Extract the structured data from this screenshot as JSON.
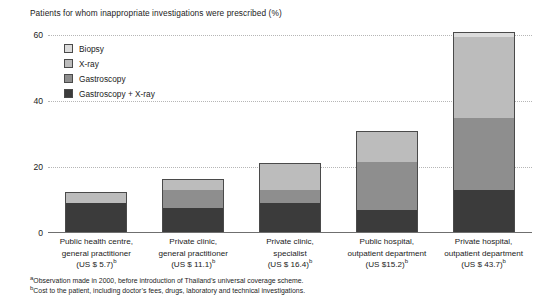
{
  "chart_data": {
    "type": "bar",
    "title": "Patients for whom inappropriate investigations were prescribed (%)",
    "xlabel": "",
    "ylabel": "",
    "ylim": [
      0,
      60
    ],
    "yticks": [
      0,
      20,
      40,
      60
    ],
    "ytick_labels": [
      "0",
      "20",
      "40",
      "60"
    ],
    "grid": true,
    "stacked": true,
    "legend_position": "upper-left-inside",
    "categories": [
      "Public health centre, general practitioner (US $ 5.7)",
      "Private clinic, general practitioner (US $ 11.1)",
      "Private clinic, specialist (US $ 16.4)",
      "Public hospital, outpatient department (US $15.2)",
      "Private hospital, outpatient department (US $ 43.7)"
    ],
    "series": [
      {
        "name": "Gastroscopy + X-ray",
        "color": "#3b3b3b",
        "values": [
          9.0,
          7.5,
          9.0,
          7.0,
          13.0
        ]
      },
      {
        "name": "Gastroscopy",
        "color": "#8e8e8e",
        "values": [
          0.0,
          5.5,
          4.0,
          14.5,
          22.0
        ]
      },
      {
        "name": "X-ray",
        "color": "#bcbcbc",
        "values": [
          3.5,
          3.3,
          8.3,
          9.5,
          24.5
        ]
      },
      {
        "name": "Biopsy",
        "color": "#dcdcdc",
        "values": [
          0.0,
          0.0,
          0.0,
          0.0,
          1.5
        ]
      }
    ],
    "totals": [
      12.5,
      16.3,
      21.3,
      31.0,
      61.0
    ]
  },
  "legend": {
    "items": [
      {
        "label": "Biopsy",
        "color": "#dcdcdc"
      },
      {
        "label": "X-ray",
        "color": "#bcbcbc"
      },
      {
        "label": "Gastroscopy",
        "color": "#8e8e8e"
      },
      {
        "label": "Gastroscopy + X-ray",
        "color": "#3b3b3b"
      }
    ]
  },
  "categories": [
    {
      "line1": "Public health centre,",
      "line2": "general practitioner",
      "line3": "(US $ 5.7)",
      "marker": "b"
    },
    {
      "line1": "Private clinic,",
      "line2": "general practitioner",
      "line3": "(US $ 11.1)",
      "marker": "b"
    },
    {
      "line1": "Private clinic,",
      "line2": "specialist",
      "line3": "(US $ 16.4)",
      "marker": "b"
    },
    {
      "line1": "Public hospital,",
      "line2": "outpatient department",
      "line3": "(US $15.2)",
      "marker": "b"
    },
    {
      "line1": "Private hospital,",
      "line2": "outpatient department",
      "line3": "(US $ 43.7)",
      "marker": "b"
    }
  ],
  "yaxis": {
    "ticks": [
      "60",
      "40",
      "20",
      "0"
    ]
  },
  "footnotes": [
    {
      "marker": "a",
      "text": "Observation made in 2000, before introduction of Thailand’s universal coverage scheme."
    },
    {
      "marker": "b",
      "text": "Cost to the patient, including doctor’s fees, drugs, laboratory and technical investigations."
    }
  ]
}
